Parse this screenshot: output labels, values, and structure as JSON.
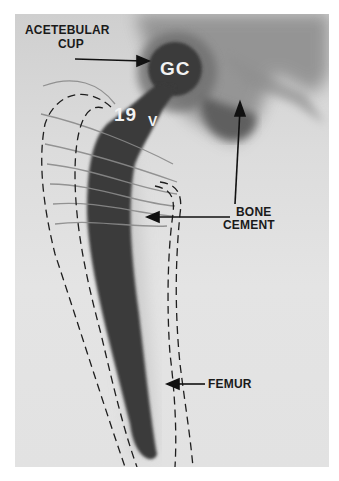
{
  "figure": {
    "labels": {
      "acetabular_cup": [
        "ACETEBULAR",
        "CUP"
      ],
      "bone_cement": [
        "BONE",
        "CEMENT"
      ],
      "femur": "FEMUR"
    },
    "implant_markings": {
      "head": "GC",
      "neck": "19",
      "neck_symbol": "V"
    }
  }
}
